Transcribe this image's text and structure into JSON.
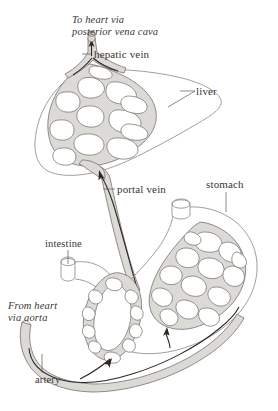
{
  "figure": {
    "type": "anatomical-diagram",
    "background_color": "#ffffff",
    "ink_color": "#3a3633",
    "vessel_fill_color": "#d8d6d2",
    "organ_outline_color": "#8a8580"
  },
  "labels": {
    "to_heart": {
      "line1": "To heart via",
      "line2": "posterior vena cava",
      "style": "italic"
    },
    "hepatic_vein": "hepatic vein",
    "liver": "liver",
    "portal_vein": "portal vein",
    "stomach": "stomach",
    "intestine": "intestine",
    "from_heart": {
      "line1": "From heart",
      "line2": "via aorta",
      "style": "italic"
    },
    "artery": "artery"
  },
  "structures": [
    {
      "name": "liver",
      "label": "liver",
      "has_capillary_network": true
    },
    {
      "name": "stomach",
      "label": "stomach",
      "has_capillary_network": true
    },
    {
      "name": "intestine",
      "label": "intestine",
      "has_capillary_network": true
    },
    {
      "name": "hepatic-vein",
      "label": "hepatic vein",
      "flow": "to heart"
    },
    {
      "name": "portal-vein",
      "label": "portal vein",
      "flow": "to liver"
    },
    {
      "name": "artery",
      "label": "artery",
      "flow": "from heart"
    }
  ]
}
